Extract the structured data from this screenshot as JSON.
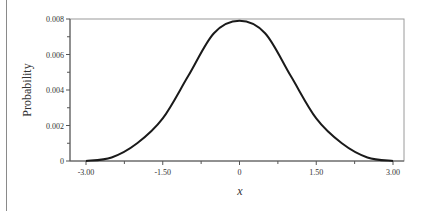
{
  "chart_data": {
    "type": "line",
    "title": "",
    "xlabel": "x",
    "ylabel": "Probability",
    "xlim": [
      -3.3,
      3.3
    ],
    "ylim": [
      0,
      0.008
    ],
    "grid": false,
    "legend": null,
    "x_ticks": [
      -3.0,
      -1.5,
      0,
      1.5,
      3.0
    ],
    "x_tick_labels": [
      "-3.00",
      "-1.50",
      "0",
      "1.50",
      "3.00"
    ],
    "x_minor_ticks": [
      -2.25,
      -0.75,
      0.75,
      2.25
    ],
    "y_ticks": [
      0,
      0.002,
      0.004,
      0.006,
      0.008
    ],
    "y_tick_labels": [
      "0",
      "0.002",
      "0.004",
      "0.006",
      "0.008"
    ],
    "y_minor_ticks": [
      0.001,
      0.003,
      0.005,
      0.007
    ],
    "series": [
      {
        "name": "density",
        "color": "#1a1a1a",
        "x": [
          -3.0,
          -2.5,
          -2.0,
          -1.5,
          -1.0,
          -0.5,
          0.0,
          0.5,
          1.0,
          1.5,
          2.0,
          2.5,
          3.0
        ],
        "y": [
          0.0,
          0.0002,
          0.001,
          0.0024,
          0.0048,
          0.0072,
          0.0079,
          0.0072,
          0.0048,
          0.0024,
          0.001,
          0.0002,
          0.0
        ]
      }
    ]
  }
}
